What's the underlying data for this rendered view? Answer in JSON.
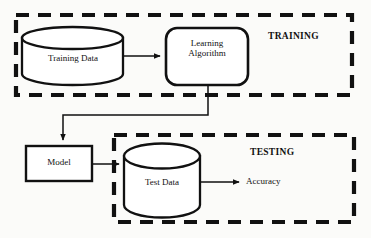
{
  "diagram": {
    "background_color": "#fbfbf9",
    "stroke_color": "#111111",
    "fill_color": "#ffffff",
    "regions": [
      {
        "id": "training",
        "label": "TRAINING",
        "style": "dashed",
        "x": 16,
        "y": 15,
        "width": 336,
        "height": 80,
        "label_x": 268,
        "label_y": 31,
        "label_size": 9.5
      },
      {
        "id": "testing",
        "label": "TESTING",
        "style": "dashed",
        "x": 114,
        "y": 135,
        "width": 240,
        "height": 87,
        "label_x": 250,
        "label_y": 147,
        "label_size": 9.5
      }
    ],
    "nodes": [
      {
        "id": "training-data",
        "label": "Training Data",
        "shape": "cylinder",
        "x": 22,
        "y": 27,
        "width": 101,
        "height": 58,
        "label_x": 33,
        "label_y": 53,
        "label_width": 80,
        "label_size": 9
      },
      {
        "id": "learning-algorithm",
        "label": "Learning\nAlgorithm",
        "label_line1": "Learning",
        "label_line2": "Algorithm",
        "shape": "rounded-rect",
        "x": 166,
        "y": 28,
        "width": 82,
        "height": 57,
        "label_x": 172,
        "label_y": 38,
        "label_width": 70,
        "label_size": 9
      },
      {
        "id": "model",
        "label": "Model",
        "shape": "rect",
        "x": 26,
        "y": 146,
        "width": 66,
        "height": 35,
        "label_x": 31,
        "label_y": 157,
        "label_width": 56,
        "label_size": 9
      },
      {
        "id": "test-data",
        "label": "Test Data",
        "shape": "cylinder",
        "x": 124,
        "y": 143,
        "width": 76,
        "height": 75,
        "label_x": 128,
        "label_y": 177,
        "label_width": 68,
        "label_size": 9
      }
    ],
    "edges": [
      {
        "id": "training-data-to-learning-algorithm",
        "from": "training-data",
        "to": "learning-algorithm",
        "points": "123,56 163,56",
        "arrow": true
      },
      {
        "id": "learning-algorithm-to-model",
        "from": "learning-algorithm",
        "to": "model",
        "points": "208,85 208,115 63,115 63,143",
        "arrow": true
      },
      {
        "id": "model-to-test-data",
        "from": "model",
        "to": "test-data",
        "points": "92,164 122,164",
        "arrow": true
      },
      {
        "id": "test-data-to-accuracy",
        "from": "test-data",
        "to": "accuracy",
        "points": "200,182 242,182",
        "arrow": true
      }
    ],
    "endpoints": [
      {
        "id": "accuracy",
        "label": "Accuracy",
        "x": 246,
        "y": 175,
        "size": 9
      }
    ]
  }
}
